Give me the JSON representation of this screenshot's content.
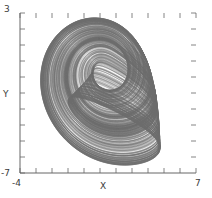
{
  "chart_data": {
    "type": "line",
    "title": "",
    "subtitle": "",
    "xlabel": "X",
    "ylabel": "Y",
    "xlim": [
      -4,
      7
    ],
    "ylim": [
      -7,
      3
    ],
    "xticks": [
      -4,
      -3,
      -2,
      -1,
      0,
      1,
      2,
      3,
      4,
      5,
      6,
      7
    ],
    "yticks": [
      -7,
      -6,
      -5,
      -4,
      -3,
      -2,
      -1,
      0,
      1,
      2,
      3
    ],
    "xtick_labels": [
      "-4",
      "",
      "",
      "",
      "",
      "",
      "",
      "",
      "",
      "",
      "",
      "7"
    ],
    "ytick_labels": [
      "-7",
      "",
      "",
      "",
      "",
      "",
      "",
      "",
      "",
      "",
      "3"
    ],
    "grid": false,
    "legend": null,
    "series": [
      {
        "name": "attractor-trajectory",
        "color": "#707070",
        "description": "chaotic attractor phase portrait, densely wound folded band",
        "x_range": [
          -3.3,
          6.3
        ],
        "y_range": [
          -6.1,
          2.2
        ]
      }
    ],
    "annotations": []
  },
  "axes": {
    "x_axis_label": "X",
    "y_axis_label": "Y",
    "x_min_label": "-4",
    "x_max_label": "7",
    "y_min_label": "-7",
    "y_max_label": "3"
  },
  "style": {
    "background_color": "#ffffff",
    "axis_color": "#555555",
    "trace_color": "#707070",
    "text_color": "#3a3a3a"
  }
}
